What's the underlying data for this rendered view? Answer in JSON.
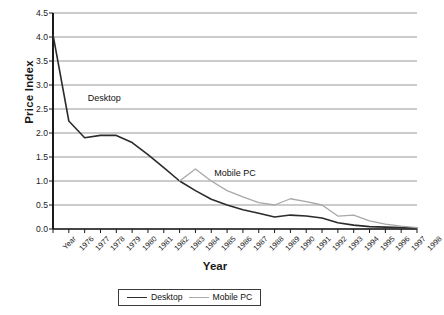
{
  "chart_data": {
    "type": "line",
    "title": "",
    "xlabel": "Year",
    "ylabel": "Price Index",
    "categories": [
      "Year",
      "1976",
      "1977",
      "1978",
      "1979",
      "1980",
      "1981",
      "1982",
      "1983",
      "1984",
      "1985",
      "1986",
      "1987",
      "1988",
      "1989",
      "1990",
      "1991",
      "1992",
      "1993",
      "1994",
      "1995",
      "1996",
      "1997",
      "1998"
    ],
    "ylim": [
      0.0,
      4.5
    ],
    "ytick_labels": [
      "0.0",
      "0.5",
      "1.0",
      "1.5",
      "2.0",
      "2.5",
      "3.0",
      "3.5",
      "4.0",
      "4.5"
    ],
    "ytick_values": [
      0.0,
      0.5,
      1.0,
      1.5,
      2.0,
      2.5,
      3.0,
      3.5,
      4.0,
      4.5
    ],
    "grid": "horizontal",
    "legend_position": "bottom",
    "series": [
      {
        "name": "Desktop",
        "color": "#2b2b2b",
        "values": [
          4.05,
          2.25,
          1.9,
          1.95,
          1.95,
          1.8,
          1.55,
          1.28,
          1.0,
          0.8,
          0.62,
          0.5,
          0.4,
          0.33,
          0.25,
          0.29,
          0.27,
          0.23,
          0.13,
          0.08,
          0.05,
          0.04,
          0.03,
          0.02
        ]
      },
      {
        "name": "Mobile PC",
        "color": "#a8a8a8",
        "values": [
          null,
          null,
          null,
          null,
          null,
          null,
          null,
          null,
          1.0,
          1.25,
          1.0,
          0.8,
          0.67,
          0.55,
          0.5,
          0.63,
          0.57,
          0.5,
          0.27,
          0.29,
          0.17,
          0.1,
          0.06,
          0.03
        ]
      }
    ],
    "annotations": [
      {
        "text": "Desktop",
        "x_category": "1977",
        "y_value": 2.7
      },
      {
        "text": "Mobile PC",
        "x_category": "1985",
        "y_value": 1.15
      }
    ]
  },
  "legend": {
    "items": [
      {
        "label": "Desktop",
        "color": "#2b2b2b"
      },
      {
        "label": "Mobile PC",
        "color": "#a8a8a8"
      }
    ]
  }
}
